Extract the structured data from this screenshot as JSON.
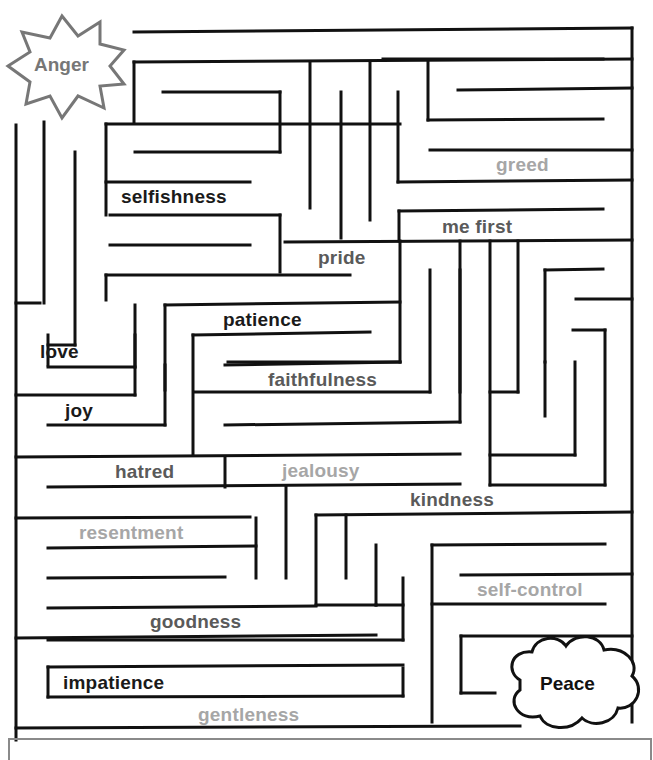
{
  "start": {
    "label": "Anger",
    "shape": "starburst",
    "color": "#777777"
  },
  "finish": {
    "label": "Peace",
    "shape": "cloud",
    "color": "#111111"
  },
  "words": [
    {
      "text": "greed",
      "x": 496,
      "y": 155,
      "shade": "light"
    },
    {
      "text": "selfishness",
      "x": 121,
      "y": 187,
      "shade": "dark"
    },
    {
      "text": "me first",
      "x": 442,
      "y": 217,
      "shade": "mid"
    },
    {
      "text": "pride",
      "x": 318,
      "y": 248,
      "shade": "mid"
    },
    {
      "text": "patience",
      "x": 223,
      "y": 310,
      "shade": "dark"
    },
    {
      "text": "love",
      "x": 40,
      "y": 342,
      "shade": "dark"
    },
    {
      "text": "faithfulness",
      "x": 268,
      "y": 370,
      "shade": "mid"
    },
    {
      "text": "joy",
      "x": 65,
      "y": 401,
      "shade": "dark"
    },
    {
      "text": "hatred",
      "x": 115,
      "y": 462,
      "shade": "mid"
    },
    {
      "text": "jealousy",
      "x": 282,
      "y": 461,
      "shade": "light"
    },
    {
      "text": "kindness",
      "x": 410,
      "y": 490,
      "shade": "mid"
    },
    {
      "text": "resentment",
      "x": 79,
      "y": 523,
      "shade": "light"
    },
    {
      "text": "self-control",
      "x": 477,
      "y": 580,
      "shade": "light"
    },
    {
      "text": "goodness",
      "x": 150,
      "y": 612,
      "shade": "mid"
    },
    {
      "text": "impatience",
      "x": 63,
      "y": 673,
      "shade": "dark"
    },
    {
      "text": "gentleness",
      "x": 198,
      "y": 705,
      "shade": "light"
    }
  ],
  "walls": [
    [
      134,
      32,
      632,
      28
    ],
    [
      632,
      28,
      632,
      722
    ],
    [
      134,
      62,
      134,
      122
    ],
    [
      134,
      62,
      632,
      59
    ],
    [
      603,
      59,
      383,
      59
    ],
    [
      163,
      92,
      280,
      92
    ],
    [
      280,
      92,
      280,
      152
    ],
    [
      458,
      90,
      632,
      88
    ],
    [
      44,
      122,
      44,
      303
    ],
    [
      106,
      124,
      400,
      124
    ],
    [
      106,
      124,
      106,
      215
    ],
    [
      428,
      62,
      428,
      120
    ],
    [
      428,
      120,
      603,
      119
    ],
    [
      135,
      152,
      280,
      152
    ],
    [
      310,
      62,
      310,
      208
    ],
    [
      341,
      92,
      341,
      238
    ],
    [
      370,
      62,
      370,
      220
    ],
    [
      398,
      92,
      398,
      182
    ],
    [
      398,
      182,
      632,
      180
    ],
    [
      106,
      182,
      250,
      182
    ],
    [
      430,
      150,
      632,
      150
    ],
    [
      16,
      125,
      16,
      740
    ],
    [
      75,
      152,
      75,
      345
    ],
    [
      75,
      345,
      48,
      345
    ],
    [
      110,
      215,
      280,
      215
    ],
    [
      280,
      215,
      280,
      272
    ],
    [
      399,
      211,
      603,
      209
    ],
    [
      399,
      211,
      399,
      241
    ],
    [
      110,
      245,
      250,
      245
    ],
    [
      285,
      242,
      632,
      240
    ],
    [
      400,
      241,
      400,
      362
    ],
    [
      400,
      362,
      228,
      362
    ],
    [
      106,
      275,
      350,
      275
    ],
    [
      106,
      275,
      106,
      300
    ],
    [
      16,
      303,
      40,
      303
    ],
    [
      460,
      241,
      460,
      392
    ],
    [
      518,
      241,
      518,
      392
    ],
    [
      135,
      305,
      135,
      367
    ],
    [
      135,
      367,
      48,
      367
    ],
    [
      165,
      305,
      400,
      302
    ],
    [
      165,
      305,
      165,
      390
    ],
    [
      545,
      270,
      603,
      269
    ],
    [
      545,
      270,
      545,
      362
    ],
    [
      48,
      335,
      48,
      365
    ],
    [
      193,
      335,
      370,
      332
    ],
    [
      193,
      335,
      193,
      455
    ],
    [
      576,
      299,
      632,
      299
    ],
    [
      573,
      330,
      605,
      330
    ],
    [
      605,
      330,
      605,
      485
    ],
    [
      16,
      395,
      135,
      395
    ],
    [
      135,
      335,
      135,
      395
    ],
    [
      225,
      365,
      400,
      362
    ],
    [
      430,
      270,
      430,
      392
    ],
    [
      430,
      392,
      195,
      392
    ],
    [
      48,
      425,
      165,
      425
    ],
    [
      165,
      365,
      165,
      425
    ],
    [
      545,
      362,
      545,
      416
    ],
    [
      575,
      362,
      575,
      455
    ],
    [
      575,
      455,
      490,
      455
    ],
    [
      225,
      425,
      460,
      422
    ],
    [
      460,
      270,
      460,
      422
    ],
    [
      490,
      241,
      490,
      485
    ],
    [
      490,
      485,
      605,
      485
    ],
    [
      518,
      392,
      490,
      392
    ],
    [
      16,
      457,
      460,
      454
    ],
    [
      225,
      457,
      225,
      487
    ],
    [
      48,
      487,
      460,
      484
    ],
    [
      286,
      487,
      286,
      578
    ],
    [
      316,
      515,
      632,
      512
    ],
    [
      316,
      515,
      316,
      605
    ],
    [
      346,
      515,
      346,
      578
    ],
    [
      376,
      545,
      376,
      605
    ],
    [
      376,
      605,
      316,
      605
    ],
    [
      16,
      518,
      250,
      517
    ],
    [
      256,
      518,
      256,
      578
    ],
    [
      48,
      548,
      256,
      546
    ],
    [
      48,
      578,
      225,
      577
    ],
    [
      432,
      545,
      605,
      544
    ],
    [
      432,
      545,
      432,
      722
    ],
    [
      461,
      575,
      632,
      574
    ],
    [
      432,
      604,
      605,
      604
    ],
    [
      48,
      608,
      316,
      606
    ],
    [
      376,
      605,
      403,
      605
    ],
    [
      403,
      578,
      403,
      640
    ],
    [
      403,
      640,
      48,
      640
    ],
    [
      16,
      638,
      376,
      635
    ],
    [
      461,
      636,
      632,
      636
    ],
    [
      461,
      636,
      461,
      693
    ],
    [
      461,
      693,
      495,
      693
    ],
    [
      48,
      667,
      403,
      665
    ],
    [
      48,
      667,
      48,
      697
    ],
    [
      48,
      697,
      403,
      696
    ],
    [
      403,
      668,
      403,
      696
    ],
    [
      16,
      728,
      520,
      726
    ]
  ]
}
